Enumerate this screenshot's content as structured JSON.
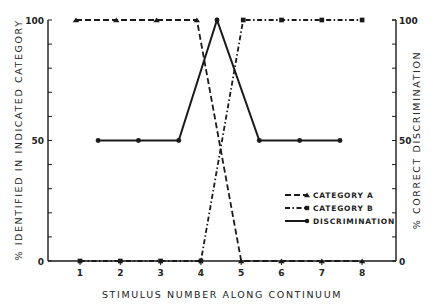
{
  "chart_data": {
    "type": "line",
    "title": "",
    "xlabel": "STIMULUS NUMBER ALONG CONTINUUM",
    "ylabel": "% IDENTIFIED IN INDICATED CATEGORY",
    "ylabel_right": "% CORRECT DISCRIMINATION",
    "xlim": [
      0.2,
      8.8
    ],
    "ylim": [
      0,
      100
    ],
    "x_ticks": [
      1,
      2,
      3,
      4,
      5,
      6,
      7,
      8
    ],
    "x_tick_labels": [
      "1",
      "2",
      "3",
      "4",
      "5",
      "6",
      "7",
      "8"
    ],
    "y_ticks": [
      0,
      10,
      20,
      30,
      40,
      50,
      60,
      70,
      80,
      90,
      100
    ],
    "y_tick_labels_left": {
      "0": "0",
      "50": "50",
      "100": "100"
    },
    "y_tick_labels_right": {
      "0": "0",
      "50": "50",
      "100": "100"
    },
    "grid": false,
    "legend_position": "lower right (inside)",
    "series": [
      {
        "name": "CATEGORY A",
        "line_style": "dashed",
        "marker": "triangle",
        "x": [
          0.9,
          1.9,
          2.9,
          3.9,
          5,
          6,
          7,
          8
        ],
        "values": [
          100,
          100,
          100,
          100,
          0,
          0,
          0,
          0
        ]
      },
      {
        "name": "CATEGORY B",
        "line_style": "dash-dot",
        "marker": "square",
        "x": [
          1,
          2,
          3,
          4,
          5.05,
          6,
          7,
          8
        ],
        "values": [
          0,
          0,
          0,
          0,
          100,
          100,
          100,
          100
        ]
      },
      {
        "name": "DISCRIMINATION",
        "line_style": "solid",
        "marker": "circle",
        "x": [
          1.45,
          2.45,
          3.45,
          4.4,
          5.45,
          6.45,
          7.45
        ],
        "values": [
          50,
          50,
          50,
          100,
          50,
          50,
          50
        ]
      }
    ]
  },
  "legend": {
    "items": [
      {
        "label": "CATEGORY A"
      },
      {
        "label": "CATEGORY B"
      },
      {
        "label": "DISCRIMINATION"
      }
    ]
  },
  "axes": {
    "x_title": "STIMULUS NUMBER ALONG CONTINUUM",
    "y_left_title": "% IDENTIFIED IN INDICATED CATEGORY",
    "y_right_title": "% CORRECT DISCRIMINATION"
  },
  "colors": {
    "ink": "#1a1a1a",
    "background": "#ffffff"
  }
}
